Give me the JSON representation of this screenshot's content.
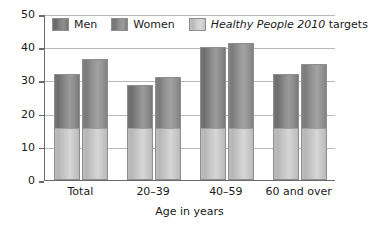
{
  "chart_data": {
    "type": "bar",
    "title": "",
    "subtitle": "",
    "xlabel": "Age in years",
    "ylabel": "",
    "categories": [
      "Total",
      "20–39",
      "40–59",
      "60 and over"
    ],
    "series": [
      {
        "name": "Men",
        "values": [
          32.0,
          28.7,
          40.1,
          31.8
        ]
      },
      {
        "name": "Women",
        "values": [
          36.3,
          31.0,
          41.4,
          35.0
        ]
      }
    ],
    "reference_band": {
      "name": "Healthy People 2010 targets",
      "value": 15.3,
      "applies_to": "all bars"
    },
    "ylim": [
      0,
      50
    ],
    "yticks": [
      0,
      10,
      20,
      30,
      40,
      50
    ],
    "ytick_labels": [
      "0",
      "10",
      "20",
      "30",
      "40",
      "50"
    ],
    "grid": true,
    "legend_position": "top-inside",
    "colors": {
      "men": "#7a7a7a",
      "women": "#8a8a8a",
      "target": "#c6c6c6",
      "gridline": "#b9b9b9",
      "axis": "#6b6b6b",
      "text": "#1a1a1a",
      "background": "#ffffff"
    }
  },
  "legend": {
    "items": [
      {
        "label": "Men",
        "italic_part": "",
        "plain_part": "Men",
        "swatch": "men"
      },
      {
        "label": "Women",
        "italic_part": "",
        "plain_part": "Women",
        "swatch": "women"
      },
      {
        "label": "Healthy People 2010 targets",
        "italic_part": "Healthy People 2010",
        "plain_part": " targets",
        "swatch": "target"
      }
    ]
  },
  "axes": {
    "y": {
      "tick_labels": [
        "50",
        "40",
        "30",
        "20",
        "10",
        "0"
      ]
    },
    "x": {
      "title": "Age in years",
      "tick_labels": [
        "Total",
        "20–39",
        "40–59",
        "60 and over"
      ]
    }
  }
}
